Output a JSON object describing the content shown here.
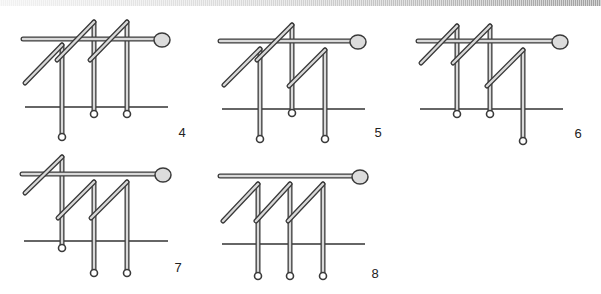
{
  "page": {
    "width": 601,
    "height": 294,
    "background": "#ffffff"
  },
  "style": {
    "stroke_dark": "#3a3a3a",
    "stroke_fill": "#d9d9d9",
    "head_fill": "#dcdcdc",
    "baseline_color": "#333333"
  },
  "figures": [
    {
      "label": "4",
      "label_pos": [
        182,
        137
      ],
      "bar": {
        "x1": 23,
        "x2": 154,
        "y": 39
      },
      "head": {
        "cx": 162,
        "cy": 40,
        "r": 8
      },
      "baseline": {
        "x1": 25,
        "x2": 168,
        "y": 107
      },
      "hooks": [
        {
          "diag": [
            25,
            83,
            62,
            45
          ],
          "stem_x": 62,
          "stem_top": 45,
          "loop_y": 137
        },
        {
          "diag": [
            57,
            60,
            94,
            22
          ],
          "stem_x": 94,
          "stem_top": 22,
          "loop_y": 114
        },
        {
          "diag": [
            90,
            60,
            127,
            22
          ],
          "stem_x": 127,
          "stem_top": 22,
          "loop_y": 114
        }
      ]
    },
    {
      "label": "5",
      "label_pos": [
        378,
        137
      ],
      "bar": {
        "x1": 220,
        "x2": 350,
        "y": 41
      },
      "head": {
        "cx": 358,
        "cy": 42,
        "r": 8
      },
      "baseline": {
        "x1": 222,
        "x2": 365,
        "y": 109
      },
      "hooks": [
        {
          "diag": [
            224,
            85,
            260,
            49
          ],
          "stem_x": 260,
          "stem_top": 49,
          "loop_y": 139
        },
        {
          "diag": [
            257,
            60,
            292,
            25
          ],
          "stem_x": 292,
          "stem_top": 25,
          "loop_y": 113
        },
        {
          "diag": [
            289,
            86,
            325,
            50
          ],
          "stem_x": 325,
          "stem_top": 50,
          "loop_y": 139
        }
      ]
    },
    {
      "label": "6",
      "label_pos": [
        578,
        138
      ],
      "bar": {
        "x1": 418,
        "x2": 552,
        "y": 41
      },
      "head": {
        "cx": 560,
        "cy": 42,
        "r": 8
      },
      "baseline": {
        "x1": 420,
        "x2": 563,
        "y": 109
      },
      "hooks": [
        {
          "diag": [
            421,
            63,
            457,
            26
          ],
          "stem_x": 457,
          "stem_top": 26,
          "loop_y": 114
        },
        {
          "diag": [
            453,
            63,
            490,
            26
          ],
          "stem_x": 490,
          "stem_top": 26,
          "loop_y": 114
        },
        {
          "diag": [
            487,
            86,
            523,
            50
          ],
          "stem_x": 523,
          "stem_top": 50,
          "loop_y": 141
        }
      ]
    },
    {
      "label": "7",
      "label_pos": [
        178,
        272
      ],
      "bar": {
        "x1": 22,
        "x2": 155,
        "y": 174
      },
      "head": {
        "cx": 163,
        "cy": 175,
        "r": 8
      },
      "baseline": {
        "x1": 24,
        "x2": 168,
        "y": 241
      },
      "hooks": [
        {
          "diag": [
            25,
            193,
            62,
            157
          ],
          "stem_x": 62,
          "stem_top": 157,
          "loop_y": 248
        },
        {
          "diag": [
            58,
            218,
            94,
            182
          ],
          "stem_x": 94,
          "stem_top": 182,
          "loop_y": 273
        },
        {
          "diag": [
            91,
            218,
            127,
            182
          ],
          "stem_x": 127,
          "stem_top": 182,
          "loop_y": 273
        }
      ]
    },
    {
      "label": "8",
      "label_pos": [
        375,
        278
      ],
      "bar": {
        "x1": 220,
        "x2": 352,
        "y": 176
      },
      "head": {
        "cx": 360,
        "cy": 177,
        "r": 8
      },
      "baseline": {
        "x1": 222,
        "x2": 365,
        "y": 244
      },
      "hooks": [
        {
          "diag": [
            223,
            221,
            258,
            184
          ],
          "stem_x": 258,
          "stem_top": 184,
          "loop_y": 276
        },
        {
          "diag": [
            256,
            221,
            290,
            184
          ],
          "stem_x": 290,
          "stem_top": 184,
          "loop_y": 276
        },
        {
          "diag": [
            288,
            221,
            323,
            184
          ],
          "stem_x": 323,
          "stem_top": 184,
          "loop_y": 276
        }
      ]
    }
  ]
}
